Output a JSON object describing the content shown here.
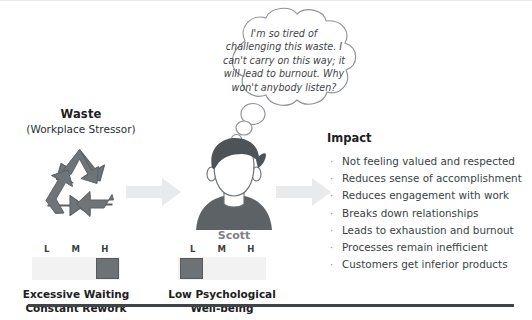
{
  "diagram": {
    "left_section": {
      "title": "Waste",
      "subtitle": "(Workplace Stressor)",
      "icon": "recycle-icon",
      "scale": {
        "labels": [
          "L",
          "M",
          "H"
        ],
        "selected": "H"
      },
      "captions": [
        "Excessive Waiting",
        "Constant Rework"
      ]
    },
    "center_section": {
      "person_name": "Scott",
      "avatar": "person-avatar-icon",
      "thought": "I'm so tired of challenging this waste. I can't carry on this way; it will lead to burnout. Why won't anybody listen?",
      "scale": {
        "labels": [
          "L",
          "M",
          "H"
        ],
        "selected": "L"
      },
      "captions": [
        "Low Psychological",
        "Well-being"
      ]
    },
    "right_section": {
      "title": "Impact",
      "bullet_glyph": "·",
      "items": [
        "Not feeling valued and respected",
        "Reduces sense of accomplishment",
        "Reduces engagement with work",
        "Breaks down relationships",
        "Leads to exhaustion and burnout",
        "Processes remain inefficient",
        "Customers get inferior products"
      ]
    },
    "colors": {
      "ink": "#3f4448",
      "marker_fill": "#6d7277",
      "track": "#f2f2f2",
      "name_gray": "#7d8186",
      "rule": "#3f4448"
    }
  }
}
